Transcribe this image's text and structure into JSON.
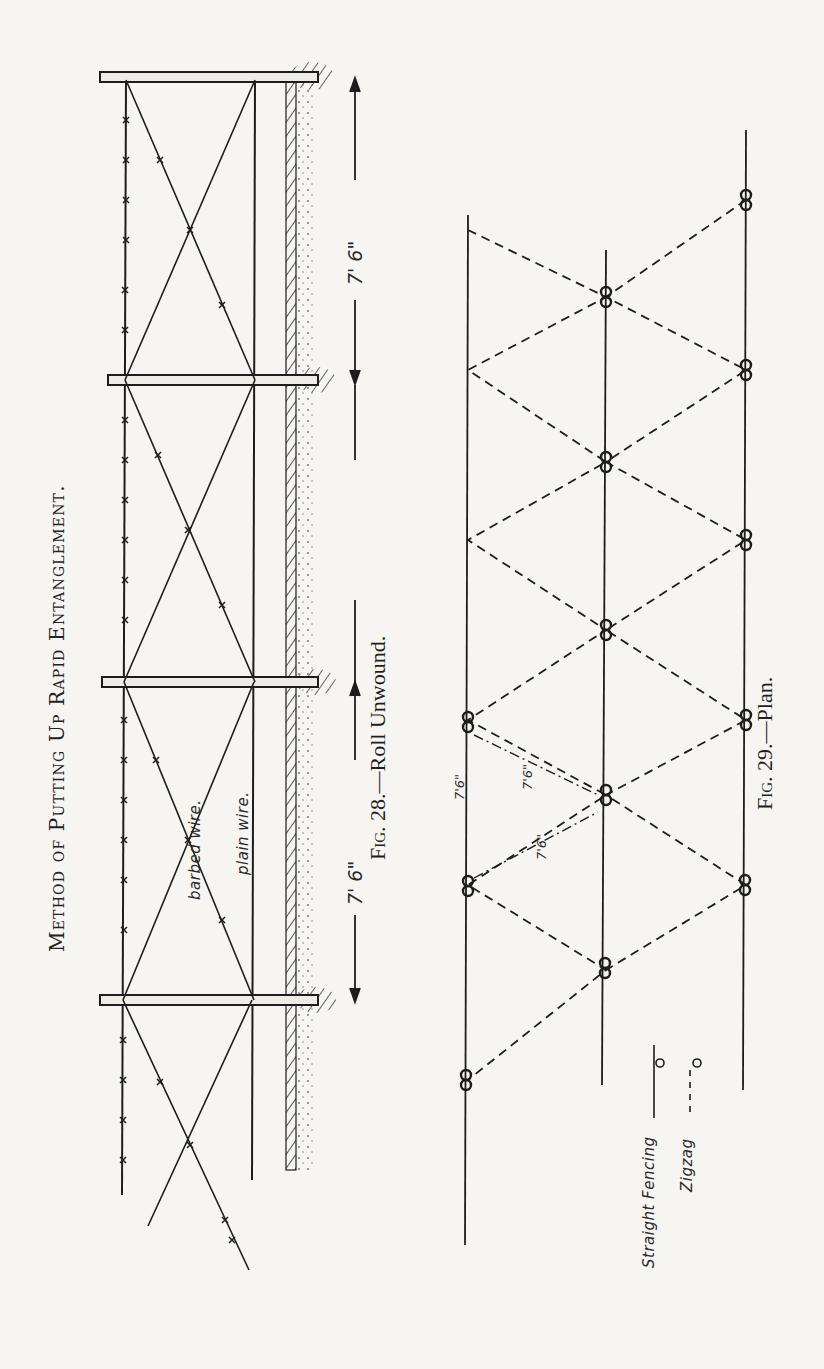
{
  "page": {
    "title": "Method of Putting Up Rapid Entanglement.",
    "orientation": "rotated 90° counter-clockwise"
  },
  "figure_28": {
    "caption_label": "Fig. 28.",
    "caption_text": "—Roll Unwound.",
    "labels": {
      "barbed_wire": "barbed wire.",
      "plain_wire": "plain wire."
    },
    "dimensions": [
      {
        "label": "7' 6\"",
        "between": "post 3 and post 4"
      },
      {
        "label": "7' 6\"",
        "between": "post 1 and post 2"
      }
    ],
    "posts_count": 4,
    "wires": [
      "barbed wire (top, with barbs)",
      "plain wire (middle)",
      "ground line with soil hatching"
    ]
  },
  "figure_29": {
    "caption_label": "Fig. 29.",
    "caption_text": "—Plan.",
    "dimensions": [
      {
        "label": "7'6\""
      },
      {
        "label": "7'6\""
      },
      {
        "label": "7'6\""
      }
    ],
    "legend": [
      {
        "label": "Straight Fencing",
        "line_style": "solid"
      },
      {
        "label": "Zigzag",
        "line_style": "dashed"
      }
    ]
  },
  "colors": {
    "paper": "#f6f5f1",
    "ink": "#1d1d1d",
    "bleed_through": "#c9c7c0"
  }
}
